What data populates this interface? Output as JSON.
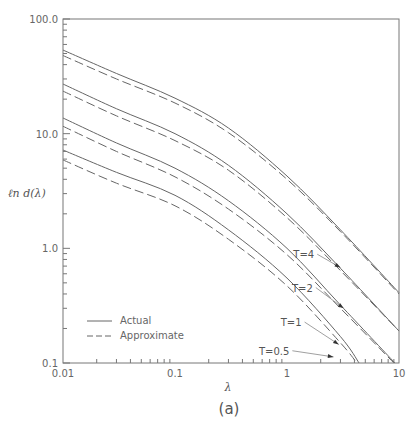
{
  "chart_data": {
    "type": "line",
    "title": "",
    "panel_label": "(a)",
    "xlabel": "λ",
    "ylabel": "ℓn d(λ)",
    "xscale": "log",
    "yscale": "log",
    "xlim": [
      0.01,
      10
    ],
    "ylim": [
      0.1,
      100
    ],
    "grid": false,
    "x_ticks": [
      {
        "value": 0.01,
        "label": "0.01"
      },
      {
        "value": 0.1,
        "label": "0.1"
      },
      {
        "value": 1,
        "label": "1"
      },
      {
        "value": 10,
        "label": "10"
      }
    ],
    "y_ticks": [
      {
        "value": 0.1,
        "label": "0.1"
      },
      {
        "value": 1,
        "label": "1.0"
      },
      {
        "value": 10,
        "label": "10.0"
      },
      {
        "value": 100,
        "label": "100.0"
      }
    ],
    "legend": {
      "position": "lower-left",
      "entries": [
        {
          "label": "Actual",
          "style": "solid"
        },
        {
          "label": "Approximate",
          "style": "dashed"
        }
      ]
    },
    "series": [
      {
        "name": "T=4 Actual",
        "T": 4,
        "style": "solid",
        "x": [
          0.01,
          0.03,
          0.1,
          0.3,
          1,
          3,
          10
        ],
        "y": [
          53.6,
          33.5,
          20.4,
          11.2,
          4.27,
          1.45,
          0.41
        ]
      },
      {
        "name": "T=4 Approximate",
        "T": 4,
        "style": "dashed",
        "x": [
          0.01,
          0.03,
          0.1,
          0.3,
          1,
          3,
          10
        ],
        "y": [
          48.0,
          30.0,
          18.5,
          10.2,
          4.0,
          1.4,
          0.4
        ]
      },
      {
        "name": "T=2 Actual",
        "T": 2,
        "style": "solid",
        "x": [
          0.01,
          0.03,
          0.1,
          0.3,
          1,
          3,
          10
        ],
        "y": [
          27.1,
          16.5,
          10.0,
          5.3,
          2.0,
          0.67,
          0.19
        ]
      },
      {
        "name": "T=2 Approximate",
        "T": 2,
        "style": "dashed",
        "x": [
          0.01,
          0.03,
          0.1,
          0.3,
          1,
          3,
          10
        ],
        "y": [
          23.5,
          14.3,
          8.7,
          4.8,
          1.85,
          0.64,
          0.19
        ]
      },
      {
        "name": "T=1 Actual",
        "T": 1,
        "style": "solid",
        "x": [
          0.01,
          0.03,
          0.1,
          0.3,
          1,
          3,
          9.2
        ],
        "y": [
          13.7,
          8.3,
          5.0,
          2.6,
          1.0,
          0.32,
          0.1
        ]
      },
      {
        "name": "T=1 Approximate",
        "T": 1,
        "style": "dashed",
        "x": [
          0.01,
          0.03,
          0.1,
          0.3,
          1,
          3,
          9.0
        ],
        "y": [
          11.6,
          7.0,
          4.2,
          2.2,
          0.88,
          0.3,
          0.1
        ]
      },
      {
        "name": "T=0.5 Actual",
        "T": 0.5,
        "style": "solid",
        "x": [
          0.01,
          0.03,
          0.1,
          0.3,
          1,
          3,
          4.4
        ],
        "y": [
          7.2,
          4.6,
          2.9,
          1.45,
          0.55,
          0.17,
          0.1
        ]
      },
      {
        "name": "T=0.5 Approximate",
        "T": 0.5,
        "style": "dashed",
        "x": [
          0.01,
          0.03,
          0.1,
          0.3,
          1,
          3,
          4.2
        ],
        "y": [
          5.9,
          3.7,
          2.35,
          1.2,
          0.47,
          0.15,
          0.1
        ]
      }
    ],
    "annotations": [
      {
        "text": "T=4",
        "text_x": 1.75,
        "text_y": 0.82,
        "arrow_to_x": 3.0,
        "arrow_to_y": 0.68
      },
      {
        "text": "T=2",
        "text_x": 1.7,
        "text_y": 0.42,
        "arrow_to_x": 3.2,
        "arrow_to_y": 0.3
      },
      {
        "text": "T=1",
        "text_x": 1.35,
        "text_y": 0.21,
        "arrow_to_x": 2.9,
        "arrow_to_y": 0.145
      },
      {
        "text": "T=0.5",
        "text_x": 1.05,
        "text_y": 0.118,
        "arrow_to_x": 2.6,
        "arrow_to_y": 0.113
      }
    ]
  }
}
